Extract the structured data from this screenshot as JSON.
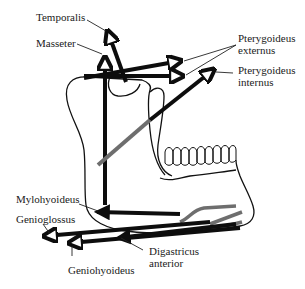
{
  "diagram": {
    "type": "anatomical vector diagram",
    "colors": {
      "bone_outline": "#111111",
      "vector_black": "#0d0d0d",
      "vector_grey": "#6e6e6e",
      "background": "#ffffff"
    },
    "labels": {
      "temporalis": "Temporalis",
      "masseter": "Masseter",
      "pterygoideus_externus_1": "Pterygoideus",
      "pterygoideus_externus_2": "externus",
      "pterygoideus_internus_1": "Pterygoideus",
      "pterygoideus_internus_2": "internus",
      "mylohyoideus": "Mylohyoideus",
      "genioglossus": "Genioglossus",
      "geniohyoideus": "Geniohyoideus",
      "digastricus_anterior_1": "Digastricus",
      "digastricus_anterior_2": "anterior"
    },
    "muscles": [
      {
        "name": "Temporalis",
        "direction": "up-left"
      },
      {
        "name": "Masseter",
        "direction": "up"
      },
      {
        "name": "Pterygoideus externus",
        "direction": "forward (two vectors)"
      },
      {
        "name": "Pterygoideus internus",
        "direction": "up-forward",
        "color": "grey/black"
      },
      {
        "name": "Mylohyoideus",
        "direction": "back-down"
      },
      {
        "name": "Genioglossus",
        "direction": "back"
      },
      {
        "name": "Geniohyoideus",
        "direction": "back"
      },
      {
        "name": "Digastricus anterior",
        "direction": "back-down"
      }
    ]
  }
}
